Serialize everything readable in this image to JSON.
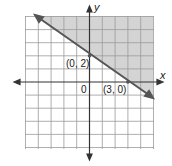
{
  "graph": {
    "x_axis_label": "x",
    "y_axis_label": "y",
    "origin_label": "0",
    "point_labels": [
      "(0, 2)",
      "(3, 0)"
    ],
    "boundary_line": "through (0, 2) and (3, 0), solid",
    "shaded_region": "above the line",
    "colors": {
      "shade": "#d4d4d4",
      "grid": "#9a9a9a",
      "line": "#555555",
      "axis": "#333333"
    }
  }
}
